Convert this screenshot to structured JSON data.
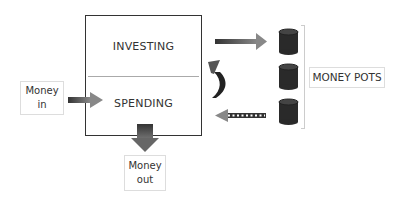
{
  "diagram": {
    "main_box": {
      "top_section": "INVESTING",
      "bottom_section": "SPENDING"
    },
    "money_in": {
      "line1": "Money",
      "line2": "in"
    },
    "money_out": {
      "line1": "Money",
      "line2": "out"
    },
    "money_pots": {
      "label": "MONEY POTS",
      "count": 3
    },
    "arrows": [
      {
        "from": "money_in",
        "to": "spending",
        "style": "solid"
      },
      {
        "from": "spending",
        "to": "money_out",
        "style": "solid-thick"
      },
      {
        "from": "investing",
        "to": "money_pots",
        "style": "solid"
      },
      {
        "from": "money_pots",
        "to": "spending",
        "style": "dotted"
      },
      {
        "from": "spending",
        "to": "investing",
        "style": "curved"
      }
    ],
    "colors": {
      "arrow_dark": "#333333",
      "arrow_mid": "#777777",
      "pot": "#2a2a2a",
      "border": "#333333"
    }
  }
}
